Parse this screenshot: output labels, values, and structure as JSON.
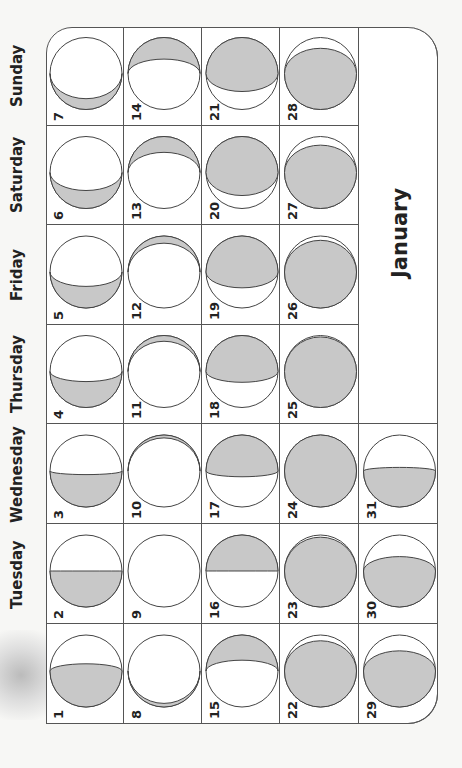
{
  "calendar": {
    "month": "January",
    "weekdays": [
      {
        "name": "Sunday",
        "y_center": 76
      },
      {
        "name": "Saturday",
        "y_center": 175
      },
      {
        "name": "Friday",
        "y_center": 275
      },
      {
        "name": "Thursday",
        "y_center": 374
      },
      {
        "name": "Wednesday",
        "y_center": 474
      },
      {
        "name": "Tuesday",
        "y_center": 574
      },
      {
        "name": "Monday",
        "y_center": 674
      }
    ],
    "days": [
      {
        "day": 7,
        "row": 0,
        "col": 0,
        "lit": "upper",
        "shade": 0.15
      },
      {
        "day": 14,
        "row": 0,
        "col": 1,
        "lit": "lower",
        "shade": 0.3
      },
      {
        "day": 21,
        "row": 0,
        "col": 2,
        "lit": "lower",
        "shade": 0.75
      },
      {
        "day": 28,
        "row": 0,
        "col": 3,
        "lit": "upper",
        "shade": 0.85
      },
      {
        "day": 6,
        "row": 1,
        "col": 0,
        "lit": "upper",
        "shade": 0.25
      },
      {
        "day": 13,
        "row": 1,
        "col": 1,
        "lit": "lower",
        "shade": 0.22
      },
      {
        "day": 20,
        "row": 1,
        "col": 2,
        "lit": "lower",
        "shade": 0.82
      },
      {
        "day": 27,
        "row": 1,
        "col": 3,
        "lit": "upper",
        "shade": 0.88
      },
      {
        "day": 5,
        "row": 2,
        "col": 0,
        "lit": "upper",
        "shade": 0.3
      },
      {
        "day": 12,
        "row": 2,
        "col": 1,
        "lit": "lower",
        "shade": 0.1
      },
      {
        "day": 19,
        "row": 2,
        "col": 2,
        "lit": "lower",
        "shade": 0.72
      },
      {
        "day": 26,
        "row": 2,
        "col": 3,
        "lit": "upper",
        "shade": 0.94
      },
      {
        "day": 4,
        "row": 3,
        "col": 0,
        "lit": "upper",
        "shade": 0.36
      },
      {
        "day": 11,
        "row": 3,
        "col": 1,
        "lit": "lower",
        "shade": 0.08
      },
      {
        "day": 18,
        "row": 3,
        "col": 2,
        "lit": "lower",
        "shade": 0.65
      },
      {
        "day": 25,
        "row": 3,
        "col": 3,
        "lit": "upper",
        "shade": 0.98
      },
      {
        "day": 3,
        "row": 4,
        "col": 0,
        "lit": "upper",
        "shade": 0.45
      },
      {
        "day": 10,
        "row": 4,
        "col": 1,
        "lit": "lower",
        "shade": 0.04
      },
      {
        "day": 17,
        "row": 4,
        "col": 2,
        "lit": "lower",
        "shade": 0.58
      },
      {
        "day": 24,
        "row": 4,
        "col": 3,
        "lit": "upper",
        "shade": 1.0
      },
      {
        "day": 31,
        "row": 4,
        "col": 4,
        "lit": "upper",
        "shade": 0.55
      },
      {
        "day": 2,
        "row": 5,
        "col": 0,
        "lit": "upper",
        "shade": 0.5
      },
      {
        "day": 9,
        "row": 5,
        "col": 1,
        "lit": "lower",
        "shade": 0.0
      },
      {
        "day": 16,
        "row": 5,
        "col": 2,
        "lit": "lower",
        "shade": 0.5
      },
      {
        "day": 23,
        "row": 5,
        "col": 3,
        "lit": "upper",
        "shade": 0.97
      },
      {
        "day": 30,
        "row": 5,
        "col": 4,
        "lit": "upper",
        "shade": 0.7
      },
      {
        "day": 1,
        "row": 6,
        "col": 0,
        "lit": "upper",
        "shade": 0.6
      },
      {
        "day": 8,
        "row": 6,
        "col": 1,
        "lit": "upper",
        "shade": 0.05
      },
      {
        "day": 15,
        "row": 6,
        "col": 2,
        "lit": "lower",
        "shade": 0.35
      },
      {
        "day": 22,
        "row": 6,
        "col": 3,
        "lit": "upper",
        "shade": 0.92
      },
      {
        "day": 29,
        "row": 6,
        "col": 4,
        "lit": "upper",
        "shade": 0.78
      }
    ],
    "colors": {
      "shade": "#c8c8c8",
      "line": "#555555",
      "paper": "#ffffff"
    }
  }
}
